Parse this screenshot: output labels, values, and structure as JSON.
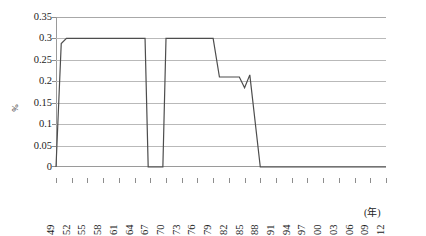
{
  "chart_data": {
    "type": "line",
    "title": "",
    "xlabel": "(年)",
    "ylabel": "%",
    "ylim": [
      0,
      0.35
    ],
    "ytick_values": [
      0,
      0.05,
      0.1,
      0.15,
      0.2,
      0.25,
      0.3,
      0.35
    ],
    "ytick_labels": [
      "0",
      "0.05",
      "0.1",
      "0.15",
      "0.2",
      "0.25",
      "0.3",
      "0.35"
    ],
    "xlim": [
      1949,
      2012
    ],
    "xtick_labels": [
      "1949",
      "1952",
      "1955",
      "1958",
      "1961",
      "1964",
      "1967",
      "1970",
      "1973",
      "1976",
      "1979",
      "1982",
      "1985",
      "1988",
      "1991",
      "1994",
      "1997",
      "2000",
      "2003",
      "2006",
      "2009",
      "2012"
    ],
    "grid": "horizontal",
    "legend": "none",
    "line_color": "#4d4d4d",
    "series": [
      {
        "name": "rate",
        "x": [
          1949,
          1950,
          1951,
          1966,
          1966.6,
          1969.4,
          1970,
          1979,
          1980.2,
          1984,
          1985,
          1986,
          1988,
          2012
        ],
        "values": [
          0,
          0.288,
          0.3,
          0.3,
          0,
          0,
          0.3,
          0.3,
          0.21,
          0.21,
          0.185,
          0.215,
          0,
          0
        ]
      }
    ]
  }
}
